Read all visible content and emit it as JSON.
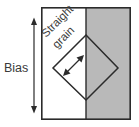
{
  "figure": {
    "name": "bias-and-straight-grain-diagram",
    "canvas": {
      "width": 139,
      "height": 127
    },
    "background_color": "#ffffff",
    "line_color": "#2b2b2b",
    "text_color": "#3a3a3a"
  },
  "labels": {
    "bias": "Bias",
    "grain_line_1": "Straight",
    "grain_line_2": "grain"
  },
  "panel": {
    "name": "fabric-rectangle",
    "x": 41,
    "y": 7,
    "width": 90,
    "height": 113,
    "white_half_color": "#ffffff",
    "gray_half_color": "#b9b9b9",
    "divider_x": 86
  },
  "diamond": {
    "name": "bias-square",
    "center_x": 86,
    "center_y": 68,
    "top": {
      "x": 86,
      "y": 35
    },
    "right": {
      "x": 118,
      "y": 68
    },
    "bottom": {
      "x": 86,
      "y": 100
    },
    "left": {
      "x": 53,
      "y": 68
    }
  },
  "bias_arrow": {
    "name": "bias-dimension-arrow",
    "x": 34,
    "y_top": 19,
    "y_bottom": 112,
    "double_headed": true
  },
  "grain_arrow": {
    "name": "straight-grain-arrow",
    "x1": 64,
    "y1": 75,
    "x2": 83,
    "y2": 56,
    "double_headed": true,
    "angle_degrees": -45
  }
}
